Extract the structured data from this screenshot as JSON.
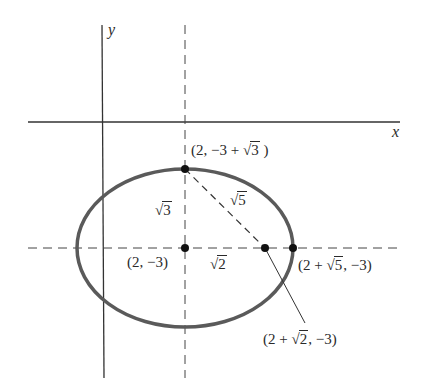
{
  "diagram": {
    "type": "ellipse-coordinate-diagram",
    "colors": {
      "axes": "#333333",
      "ellipse": "#5a5a5a",
      "dashed": "#444444",
      "points": "#111111",
      "background": "#ffffff"
    },
    "axes": {
      "x_label": "x",
      "y_label": "y"
    },
    "ellipse": {
      "center": "(2, −3)",
      "semi_major": "√5",
      "semi_minor": "√3",
      "focal_distance": "√2"
    },
    "labels": {
      "top_vertex": {
        "prefix": "(2, −3 + ",
        "radicand": "3",
        "suffix": " )"
      },
      "center": "(2, −3)",
      "right_vertex": {
        "prefix": "(2 + ",
        "radicand": "5",
        "suffix": ", −3)"
      },
      "focus": {
        "prefix": "(2 + ",
        "radicand": "2",
        "suffix": ", −3)"
      },
      "segment_minor": {
        "radicand": "3"
      },
      "segment_hyp": {
        "radicand": "5"
      },
      "segment_focal": {
        "radicand": "2"
      },
      "sqrt_sign": "√"
    }
  }
}
